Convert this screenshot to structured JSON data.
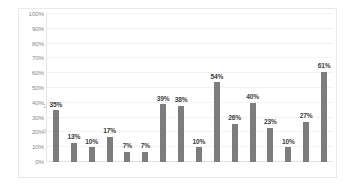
{
  "chart_data": {
    "type": "bar",
    "title": "",
    "subtitle": "",
    "xlabel": "",
    "ylabel": "",
    "ylim": [
      0,
      100
    ],
    "grid": true,
    "legend": false,
    "legend_position": "none",
    "bar_color": "#7d7d7d",
    "value_suffix": "%",
    "categories": [
      "1",
      "2",
      "3",
      "4",
      "5",
      "6",
      "7",
      "8",
      "9",
      "10",
      "11",
      "12",
      "13",
      "14",
      "15",
      "16"
    ],
    "values": [
      35,
      13,
      10,
      17,
      7,
      7,
      39,
      38,
      10,
      54,
      26,
      40,
      23,
      10,
      27,
      61
    ],
    "data_labels": [
      "35%",
      "13%",
      "10%",
      "17%",
      "7%",
      "7%",
      "39%",
      "38%",
      "10%",
      "54%",
      "26%",
      "40%",
      "23%",
      "10%",
      "27%",
      "61%"
    ],
    "y_ticks": [
      0,
      10,
      20,
      30,
      40,
      50,
      60,
      70,
      80,
      90,
      100
    ],
    "y_tick_labels": [
      "0%",
      "10%",
      "20%",
      "30%",
      "40%",
      "50%",
      "60%",
      "70%",
      "80%",
      "90%",
      "100%"
    ],
    "x_tick_labels": []
  },
  "artifacts": {
    "glyph_one": "1",
    "glyph_six": "6"
  }
}
